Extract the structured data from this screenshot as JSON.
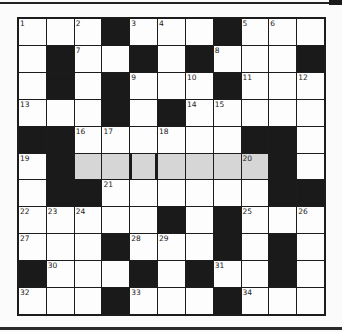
{
  "puzzle": {
    "type": "crossword",
    "rows": 11,
    "cols": 11,
    "legend": {
      "W": "white cell",
      "B": "black block",
      "G": "highlighted (grey) cell"
    },
    "grid": [
      [
        "W",
        "W",
        "W",
        "B",
        "W",
        "W",
        "W",
        "B",
        "W",
        "W",
        "W"
      ],
      [
        "W",
        "B",
        "W",
        "W",
        "B",
        "W",
        "B",
        "W",
        "W",
        "W",
        "B"
      ],
      [
        "W",
        "B",
        "W",
        "B",
        "W",
        "W",
        "W",
        "B",
        "W",
        "W",
        "W"
      ],
      [
        "W",
        "W",
        "W",
        "B",
        "W",
        "B",
        "W",
        "W",
        "W",
        "W",
        "W"
      ],
      [
        "B",
        "B",
        "W",
        "W",
        "W",
        "W",
        "W",
        "W",
        "B",
        "B",
        "W"
      ],
      [
        "W",
        "B",
        "G",
        "G",
        "G",
        "G",
        "G",
        "G",
        "G",
        "B",
        "W"
      ],
      [
        "W",
        "B",
        "B",
        "W",
        "W",
        "W",
        "W",
        "W",
        "W",
        "B",
        "B"
      ],
      [
        "W",
        "W",
        "W",
        "W",
        "W",
        "B",
        "W",
        "B",
        "W",
        "W",
        "W"
      ],
      [
        "W",
        "W",
        "W",
        "B",
        "W",
        "W",
        "W",
        "B",
        "W",
        "B",
        "W"
      ],
      [
        "B",
        "W",
        "W",
        "W",
        "B",
        "W",
        "B",
        "W",
        "W",
        "B",
        "W"
      ],
      [
        "W",
        "W",
        "W",
        "B",
        "W",
        "W",
        "W",
        "B",
        "W",
        "W",
        "W"
      ]
    ],
    "numbers": [
      [
        "1",
        "",
        "2",
        "",
        "3",
        "4",
        "",
        "",
        "5",
        "6",
        ""
      ],
      [
        "",
        "",
        "7",
        "",
        "",
        "",
        "",
        "8",
        "",
        "",
        ""
      ],
      [
        "",
        "",
        "",
        "",
        "9",
        "",
        "10",
        "",
        "11",
        "",
        "12"
      ],
      [
        "13",
        "",
        "",
        "",
        "",
        "",
        "14",
        "15",
        "",
        "",
        ""
      ],
      [
        "",
        "",
        "16",
        "17",
        "",
        "18",
        "",
        "",
        "",
        "",
        ""
      ],
      [
        "19",
        "",
        "",
        "",
        "",
        "",
        "",
        "",
        "20",
        "",
        ""
      ],
      [
        "",
        "",
        "",
        "21",
        "",
        "",
        "",
        "",
        "",
        "",
        ""
      ],
      [
        "22",
        "23",
        "24",
        "",
        "",
        "",
        "",
        "",
        "25",
        "",
        "26"
      ],
      [
        "27",
        "",
        "",
        "",
        "28",
        "29",
        "",
        "",
        "",
        "",
        ""
      ],
      [
        "",
        "30",
        "",
        "",
        "",
        "",
        "",
        "31",
        "",
        "",
        ""
      ],
      [
        "32",
        "",
        "",
        "",
        "33",
        "",
        "",
        "",
        "34",
        "",
        ""
      ]
    ],
    "thick_dividers": [
      {
        "row": 5,
        "col": 4,
        "sides": [
          "left",
          "right"
        ]
      }
    ],
    "colors": {
      "white": "#fdfdfd",
      "black": "#1a1a1a",
      "highlight": "#d6d6d6",
      "background": "#fbfbfb"
    }
  }
}
